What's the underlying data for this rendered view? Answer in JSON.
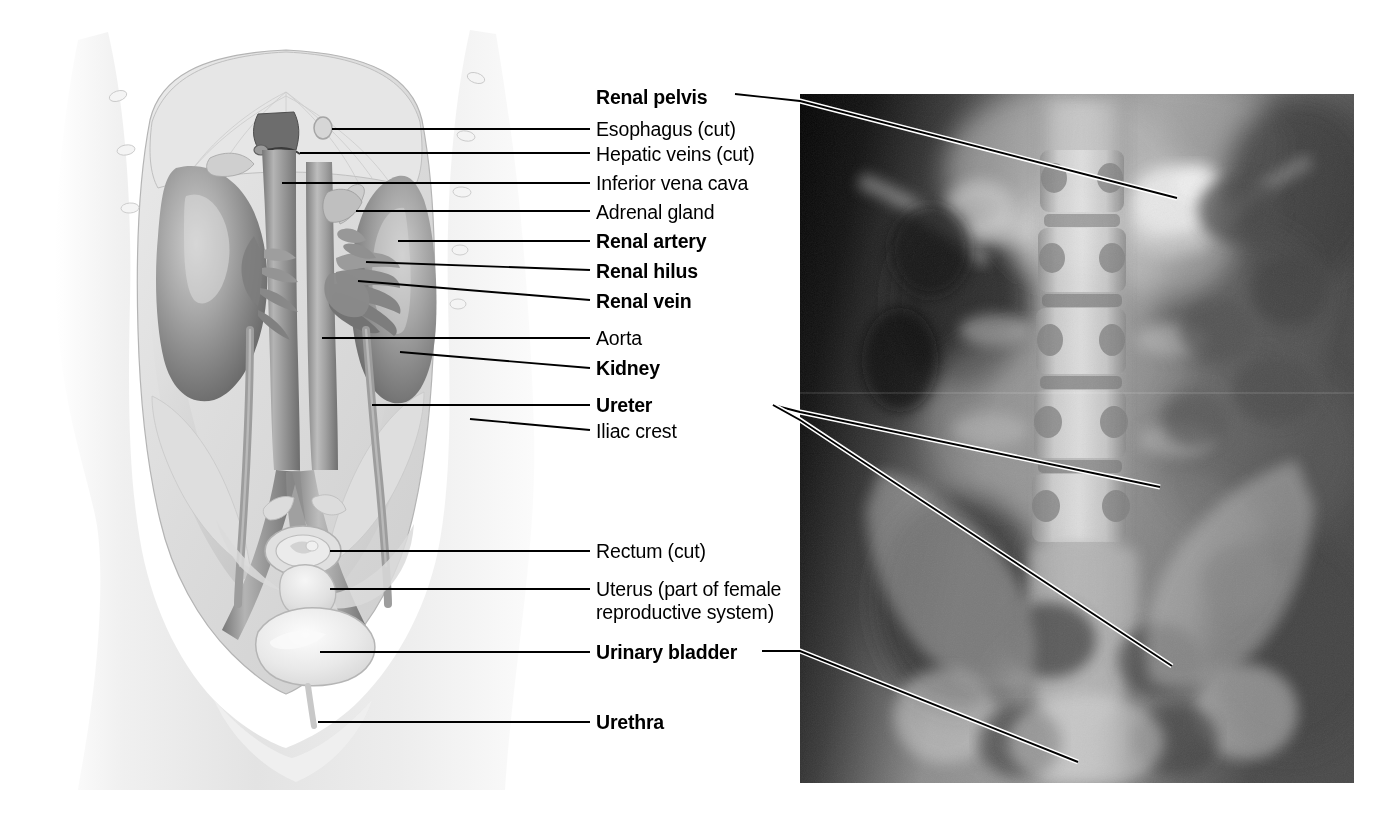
{
  "figure": {
    "type": "anatomical-plate",
    "panels": [
      {
        "name": "illustration",
        "description": "Grayscale anatomical drawing of female abdomen and pelvis, anterior view, showing kidneys, great vessels, ureters and bladder"
      },
      {
        "name": "radiograph",
        "description": "Grayscale intravenous pyelogram (IVP) X-ray of abdomen showing lumbar vertebrae, renal pelves, ureters and urinary bladder"
      }
    ]
  },
  "labels": [
    {
      "id": "renal-pelvis",
      "text": "Renal pelvis",
      "bold": true,
      "x": 596,
      "y": 86,
      "target": "radiograph"
    },
    {
      "id": "esophagus",
      "text": "Esophagus (cut)",
      "bold": false,
      "x": 596,
      "y": 118,
      "target": "illustration"
    },
    {
      "id": "hepatic-veins",
      "text": "Hepatic veins (cut)",
      "bold": false,
      "x": 596,
      "y": 143,
      "target": "illustration"
    },
    {
      "id": "inferior-vena-cava",
      "text": "Inferior vena cava",
      "bold": false,
      "x": 596,
      "y": 172,
      "target": "illustration"
    },
    {
      "id": "adrenal-gland",
      "text": "Adrenal gland",
      "bold": false,
      "x": 596,
      "y": 201,
      "target": "illustration"
    },
    {
      "id": "renal-artery",
      "text": "Renal artery",
      "bold": true,
      "x": 596,
      "y": 230,
      "target": "illustration"
    },
    {
      "id": "renal-hilus",
      "text": "Renal hilus",
      "bold": true,
      "x": 596,
      "y": 260,
      "target": "illustration"
    },
    {
      "id": "renal-vein",
      "text": "Renal vein",
      "bold": true,
      "x": 596,
      "y": 290,
      "target": "illustration"
    },
    {
      "id": "aorta",
      "text": "Aorta",
      "bold": false,
      "x": 596,
      "y": 327,
      "target": "illustration"
    },
    {
      "id": "kidney",
      "text": "Kidney",
      "bold": true,
      "x": 596,
      "y": 357,
      "target": "illustration"
    },
    {
      "id": "ureter",
      "text": "Ureter",
      "bold": true,
      "x": 596,
      "y": 394,
      "target": "both"
    },
    {
      "id": "iliac-crest",
      "text": "Iliac crest",
      "bold": false,
      "x": 596,
      "y": 420,
      "target": "illustration"
    },
    {
      "id": "rectum",
      "text": "Rectum (cut)",
      "bold": false,
      "x": 596,
      "y": 540,
      "target": "illustration"
    },
    {
      "id": "uterus",
      "text": "Uterus (part of female reproductive system)",
      "bold": false,
      "x": 596,
      "y": 578,
      "target": "illustration",
      "two_line": true
    },
    {
      "id": "urinary-bladder",
      "text": "Urinary bladder",
      "bold": true,
      "x": 596,
      "y": 641,
      "target": "both"
    },
    {
      "id": "urethra",
      "text": "Urethra",
      "bold": true,
      "x": 596,
      "y": 711,
      "target": "illustration"
    }
  ],
  "colors": {
    "background": "#ffffff",
    "text": "#000000",
    "leader_line": "#000000",
    "leader_line_outline": "#ffffff",
    "illustration_light": "#f2f2f2",
    "illustration_mid": "#b9b9b9",
    "illustration_dark": "#6f6f6f",
    "radiograph_dark": "#0a0a0a",
    "radiograph_bone": "#d8d8d8"
  },
  "geometry": {
    "illustration_bounds": {
      "x": 35,
      "y": 28,
      "width": 505,
      "height": 762
    },
    "radiograph_bounds": {
      "x": 800,
      "y": 94,
      "width": 554,
      "height": 689
    }
  }
}
